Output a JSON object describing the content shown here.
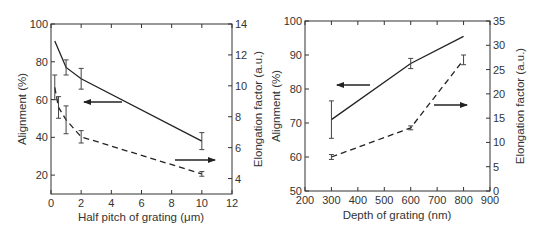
{
  "chart_data": [
    {
      "type": "line",
      "title": "",
      "xlabel": "Half pitch of grating (μm)",
      "ylabel": "Alignment (%)",
      "y2label": "Elongation factor (a.u.)",
      "xlim": [
        0,
        12
      ],
      "ylim": [
        10,
        100
      ],
      "y2lim": [
        3,
        14
      ],
      "xticks": [
        0,
        2,
        4,
        6,
        8,
        10,
        12
      ],
      "yticks": [
        20,
        40,
        60,
        80,
        100
      ],
      "y2ticks": [
        4,
        6,
        8,
        10,
        12,
        14
      ],
      "series": [
        {
          "name": "Alignment",
          "axis": "left",
          "style": "solid",
          "x": [
            0.25,
            1,
            2,
            10
          ],
          "values": [
            91,
            77,
            71,
            38
          ],
          "errors": [
            null,
            4,
            5.5,
            4.5
          ],
          "arrow": "left"
        },
        {
          "name": "Elongation factor",
          "axis": "right",
          "style": "dashed",
          "x": [
            0.25,
            0.5,
            1,
            2,
            10
          ],
          "values": [
            9.9,
            8.6,
            7.8,
            6.7,
            4.3
          ],
          "errors": [
            0.8,
            0.7,
            0.9,
            0.4,
            0.15
          ],
          "arrow": "right"
        }
      ]
    },
    {
      "type": "line",
      "title": "",
      "xlabel": "Depth of grating (nm)",
      "ylabel": "Alignment (%)",
      "y2label": "Elongation factor (a.u.)",
      "xlim": [
        200,
        900
      ],
      "ylim": [
        50,
        100
      ],
      "y2lim": [
        0,
        35
      ],
      "xticks": [
        200,
        300,
        400,
        500,
        600,
        700,
        800,
        900
      ],
      "yticks": [
        50,
        60,
        70,
        80,
        90,
        100
      ],
      "y2ticks": [
        0,
        5,
        10,
        15,
        20,
        25,
        30,
        35
      ],
      "series": [
        {
          "name": "Alignment",
          "axis": "left",
          "style": "solid",
          "x": [
            300,
            600,
            800
          ],
          "values": [
            71,
            87.5,
            95.5
          ],
          "errors": [
            5.5,
            1.5,
            null
          ],
          "arrow": "left"
        },
        {
          "name": "Elongation factor",
          "axis": "right",
          "style": "dashed",
          "x": [
            300,
            600,
            800
          ],
          "values": [
            7,
            13,
            27
          ],
          "errors": [
            0.5,
            0.4,
            1
          ],
          "arrow": "right"
        }
      ]
    }
  ],
  "left_chart": {
    "xlabel": "Half pitch of grating (μm)",
    "ylabel": "Alignment (%)",
    "y2label": "Elongation factor (a.u.)",
    "xticks": [
      "0",
      "2",
      "4",
      "6",
      "8",
      "10",
      "12"
    ],
    "yticks": [
      "20",
      "40",
      "60",
      "80",
      "100"
    ],
    "y2ticks": [
      "4",
      "6",
      "8",
      "10",
      "12",
      "14"
    ]
  },
  "right_chart": {
    "xlabel": "Depth of grating (nm)",
    "ylabel": "Alignment (%)",
    "y2label": "Elongation factor (a.u.)",
    "xticks": [
      "200",
      "300",
      "400",
      "500",
      "600",
      "700",
      "800",
      "900"
    ],
    "yticks": [
      "50",
      "60",
      "70",
      "80",
      "90",
      "100"
    ],
    "y2ticks": [
      "0",
      "5",
      "10",
      "15",
      "20",
      "25",
      "30",
      "35"
    ]
  }
}
